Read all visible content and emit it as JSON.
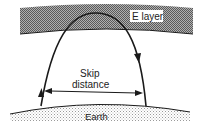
{
  "diagram": {
    "labels": {
      "layer": "E layer",
      "skip_line1": "Skip",
      "skip_line2": "distance",
      "ground": "Earth"
    },
    "colors": {
      "layer_fill": "#8a8a8a",
      "ground_fill": "#d4d4d4",
      "stroke": "#1a1a1a",
      "background": "#ffffff"
    }
  }
}
